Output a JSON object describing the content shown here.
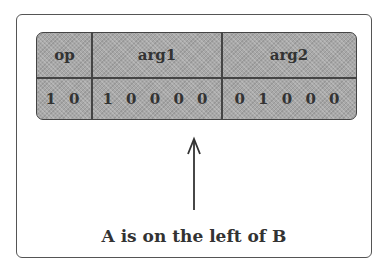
{
  "table": {
    "headers": [
      "op",
      "arg1",
      "arg2"
    ],
    "values": [
      "1 0",
      "1 0 0 0 0",
      "0 1 0 0 0"
    ]
  },
  "arrow": {
    "direction": "up"
  },
  "caption": "A is on the left of B",
  "colors": {
    "cell_fill": "#a8a8a8",
    "border": "#444444",
    "text": "#333333"
  }
}
